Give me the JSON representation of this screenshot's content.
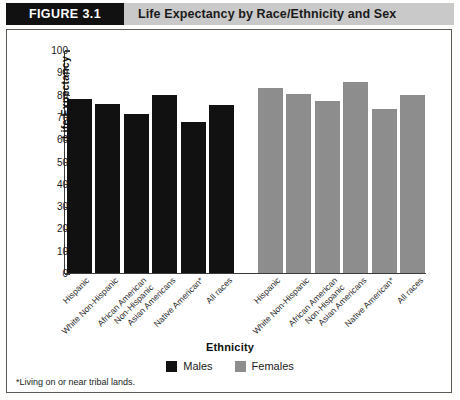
{
  "header": {
    "figure_number": "FIGURE 3.1",
    "title": "Life Expectancy by Race/Ethnicity and Sex"
  },
  "footnote": "*Living on or near tribal lands.",
  "colors": {
    "males": "#111111",
    "females": "#8d8d8d",
    "header_band": "#c9c9c9",
    "figure_number_box": "#111111",
    "axis": "#3a3a3a"
  },
  "legend": {
    "position": "bottom-center",
    "items": [
      {
        "label": "Males",
        "color": "#111111"
      },
      {
        "label": "Females",
        "color": "#8d8d8d"
      }
    ]
  },
  "chart_data": {
    "type": "bar",
    "title": "Life Expectancy by Race/Ethnicity and Sex",
    "xlabel": "Ethnicity",
    "ylabel": "Life Expectancy",
    "ylim": [
      0,
      100
    ],
    "yticks": [
      0,
      10,
      20,
      30,
      40,
      50,
      60,
      70,
      80,
      90,
      100
    ],
    "grid": false,
    "categories": [
      "Hispanic",
      "White Non-Hispanic",
      "African American Non-Hispanic",
      "Asian Americans",
      "Native American*",
      "All races"
    ],
    "series": [
      {
        "name": "Males",
        "color": "#111111",
        "values": [
          78,
          76,
          71.5,
          80,
          67.5,
          75.5
        ]
      },
      {
        "name": "Females",
        "color": "#8d8d8d",
        "values": [
          83,
          80.5,
          77,
          85.5,
          73.5,
          80
        ]
      }
    ],
    "annotations": [
      "*Living on or near tribal lands."
    ]
  }
}
